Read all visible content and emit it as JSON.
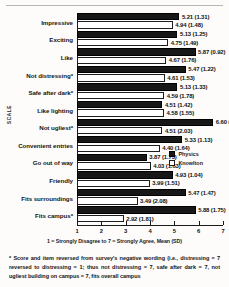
{
  "chart_data": {
    "type": "bar",
    "title": "",
    "xlabel": "1 = Strongly Disagree to 7 = Strongly Agree, Mean (SD)",
    "ylabel": "SCALE",
    "orientation": "horizontal",
    "xlim": [
      1,
      7
    ],
    "xticks": [
      "1",
      "2",
      "3",
      "4",
      "5",
      "6",
      "7"
    ],
    "grid": false,
    "legend_position": "center-right",
    "legend": [
      "Physics",
      "Knowlton"
    ],
    "categories": [
      "Impressive",
      "Exciting",
      "Like",
      "Not distressing*",
      "Safe after dark*",
      "Like lighting",
      "Not ugliest*",
      "Convenient entries",
      "Go out of way",
      "Friendly",
      "Fits surroundings",
      "Fits campus*"
    ],
    "series": [
      {
        "name": "Physics",
        "color": "#171717",
        "values": [
          5.21,
          5.13,
          5.87,
          5.47,
          5.13,
          4.51,
          6.6,
          5.33,
          3.87,
          4.93,
          5.47,
          5.88
        ],
        "sd": [
          1.31,
          1.25,
          0.92,
          1.22,
          1.33,
          1.42,
          0.83,
          1.13,
          1.73,
          1.04,
          1.47,
          1.75
        ],
        "labels": [
          "5.21 (1.31)",
          "5.13 (1.25)",
          "5.87 (0.92)",
          "5.47 (1.22)",
          "5.13 (1.33)",
          "4.51 (1.42)",
          "6.60 (0.83)",
          "5.33 (1.13)",
          "3.87 (1.73)",
          "4.93 (1.04)",
          "5.47 (1.47)",
          "5.88 (1.75)"
        ]
      },
      {
        "name": "Knowlton",
        "color": "#ffffff",
        "values": [
          4.94,
          4.75,
          4.67,
          4.61,
          4.59,
          4.58,
          4.51,
          4.4,
          4.03,
          3.99,
          3.49,
          2.92
        ],
        "sd": [
          1.48,
          1.49,
          1.76,
          1.53,
          1.78,
          1.55,
          2.03,
          1.64,
          1.63,
          1.51,
          2.08,
          1.81
        ],
        "labels": [
          "4.94 (1.48)",
          "4.75 (1.49)",
          "4.67 (1.76)",
          "4.61 (1.53)",
          "4.59 (1.78)",
          "4.58 (1.55)",
          "4.51 (2.03)",
          "4.40 (1.64)",
          "4.03 (1.63)",
          "3.99 (1.51)",
          "3.49 (2.08)",
          "2.92 (1.81)"
        ]
      }
    ]
  },
  "footnote": "* Score and item reversed from survey's negative wording (i.e., distressing = 7 reversed to distressing = 1; thus not distressing = 7, safe after dark = 7, not ugliest building on campus = 7, fits overall campus"
}
